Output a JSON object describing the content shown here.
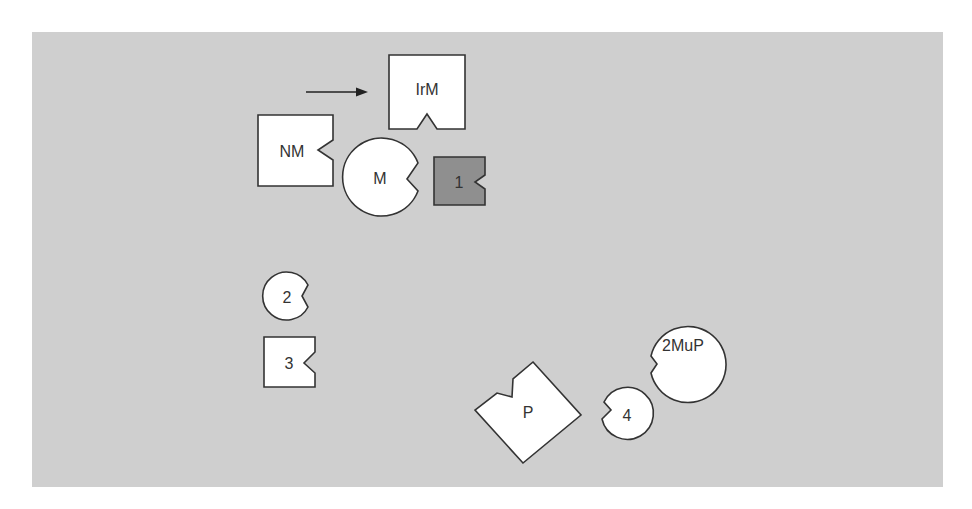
{
  "diagram": {
    "background_color": "#cfcfcf",
    "arrow": {
      "from": [
        306,
        92
      ],
      "to": [
        368,
        92
      ],
      "direction": "right"
    },
    "shapes": {
      "irm": {
        "label": "IrM",
        "type": "square-with-bottom-notch",
        "fill": "#ffffff"
      },
      "nm": {
        "label": "NM",
        "type": "square-with-right-notch",
        "fill": "#ffffff"
      },
      "m": {
        "label": "M",
        "type": "circle-with-right-notch",
        "fill": "#ffffff"
      },
      "one": {
        "label": "1",
        "type": "square-with-right-notch",
        "fill": "#8f8f8f"
      },
      "two": {
        "label": "2",
        "type": "circle-with-right-notch",
        "fill": "#ffffff"
      },
      "three": {
        "label": "3",
        "type": "square-with-right-notch",
        "fill": "#ffffff"
      },
      "p": {
        "label": "P",
        "type": "diamond-with-notch",
        "fill": "#ffffff"
      },
      "four": {
        "label": "4",
        "type": "circle-with-left-notch",
        "fill": "#ffffff"
      },
      "twomup": {
        "label": "2MuP",
        "type": "circle-with-lower-left-notch",
        "fill": "#ffffff"
      }
    }
  }
}
